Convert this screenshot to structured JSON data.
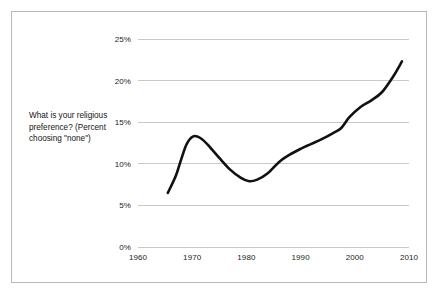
{
  "figure": {
    "border_color": "#b9b9b9",
    "background": "#ffffff"
  },
  "question_label": {
    "text": "What is your religious preference? (Percent choosing \"none\")"
  },
  "chart_data": {
    "type": "line",
    "title": "",
    "subtitle": "",
    "xlabel": "",
    "ylabel": "",
    "annotation": "What is your religious preference? (Percent choosing \"none\")",
    "grid": true,
    "grid_axis": "y",
    "grid_color": "#c9c9c9",
    "legend": false,
    "legend_position": "none",
    "line_color": "#111111",
    "line_width": 2.6,
    "xlim": [
      1960,
      2010
    ],
    "ylim": [
      0,
      25
    ],
    "x_ticks": [
      1960,
      1970,
      1980,
      1990,
      2000,
      2010
    ],
    "x_tick_labels": [
      "1960",
      "1970",
      "1980",
      "1990",
      "2000",
      "2010"
    ],
    "y_ticks": [
      0,
      5,
      10,
      15,
      20,
      25
    ],
    "y_tick_labels": [
      "0%",
      "5%",
      "10%",
      "15%",
      "20%",
      "25%"
    ],
    "series": [
      {
        "name": "Percent choosing \"none\"",
        "x": [
          1965.5,
          1967,
          1968,
          1969,
          1970.2,
          1971.5,
          1973,
          1975,
          1977,
          1979,
          1980.5,
          1982,
          1984,
          1986,
          1988,
          1990,
          1992,
          1994,
          1996,
          1997.5,
          1999,
          2001,
          2003,
          2005,
          2007,
          2008.7
        ],
        "values": [
          6.5,
          8.6,
          10.6,
          12.4,
          13.3,
          13.1,
          12.2,
          10.7,
          9.3,
          8.3,
          7.9,
          8.1,
          8.9,
          10.2,
          11.1,
          11.8,
          12.4,
          13.0,
          13.7,
          14.3,
          15.6,
          16.8,
          17.6,
          18.6,
          20.4,
          22.3
        ]
      }
    ]
  }
}
